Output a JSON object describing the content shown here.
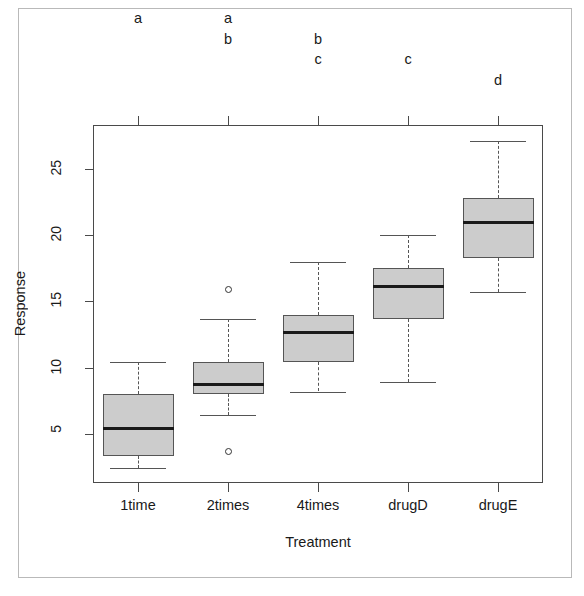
{
  "figure": {
    "title": "",
    "xlabel": "Treatment",
    "ylabel": "Response",
    "box_fill_color": "#cccccc",
    "box_border_color": "#555555",
    "median_color": "#1a1a1a",
    "frame_color": "#4a4a4a"
  },
  "chart_data": {
    "type": "box",
    "title": "",
    "xlabel": "Treatment",
    "ylabel": "Response",
    "categories": [
      "1time",
      "2times",
      "4times",
      "drugD",
      "drugE"
    ],
    "ytick_labels": [
      "5",
      "10",
      "15",
      "20",
      "25"
    ],
    "ytick_values": [
      5,
      10,
      15,
      20,
      25
    ],
    "ylim": [
      1.3,
      28.3
    ],
    "grid": false,
    "legend": "none",
    "annotations": {
      "description": "Compact letter display of post-hoc group significance above each box",
      "letters": [
        [
          "a"
        ],
        [
          "a",
          "b"
        ],
        [
          "b",
          "c"
        ],
        [
          "c"
        ],
        [
          "d"
        ]
      ]
    },
    "boxes": [
      {
        "category": "1time",
        "whisker_low": 2.4,
        "q1": 3.3,
        "median": 5.4,
        "q3": 8.0,
        "whisker_high": 10.4,
        "outliers": [],
        "letters": [
          "a"
        ]
      },
      {
        "category": "2times",
        "whisker_low": 6.4,
        "q1": 8.0,
        "median": 8.7,
        "q3": 10.4,
        "whisker_high": 13.7,
        "outliers": [
          3.7,
          15.9
        ],
        "letters": [
          "a",
          "b"
        ]
      },
      {
        "category": "4times",
        "whisker_low": 8.2,
        "q1": 10.4,
        "median": 12.6,
        "q3": 14.0,
        "whisker_high": 18.0,
        "outliers": [],
        "letters": [
          "b",
          "c"
        ]
      },
      {
        "category": "drugD",
        "whisker_low": 8.9,
        "q1": 13.7,
        "median": 16.1,
        "q3": 17.5,
        "whisker_high": 20.0,
        "outliers": [],
        "letters": [
          "c"
        ]
      },
      {
        "category": "drugE",
        "whisker_low": 15.7,
        "q1": 18.3,
        "median": 20.9,
        "q3": 22.8,
        "whisker_high": 27.1,
        "outliers": [],
        "letters": [
          "d"
        ]
      }
    ]
  }
}
